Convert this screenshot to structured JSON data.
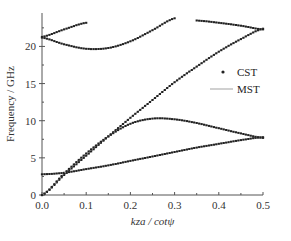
{
  "chart_data": {
    "type": "line",
    "title": "",
    "xlabel": "k_z a / cotψ",
    "ylabel": "Frequency / GHz",
    "xlim": [
      0.0,
      0.5
    ],
    "ylim": [
      0,
      24.5
    ],
    "xticks": [
      "0.0",
      "0.1",
      "0.2",
      "0.3",
      "0.4",
      "0.5"
    ],
    "yticks": [
      "0",
      "5",
      "10",
      "15",
      "20"
    ],
    "grid": false,
    "legend": {
      "position": "right-middle",
      "entries": [
        {
          "name": "CST",
          "style": "dots"
        },
        {
          "name": "MST",
          "style": "line"
        }
      ]
    },
    "x": [
      0.0,
      0.05,
      0.1,
      0.15,
      0.2,
      0.25,
      0.3,
      0.35,
      0.4,
      0.45,
      0.5
    ],
    "series": [
      {
        "name": "mode-1 (light-line-like)",
        "values": [
          0.0,
          2.7,
          5.3,
          7.9,
          10.4,
          12.8,
          15.2,
          17.3,
          19.3,
          21.0,
          22.4
        ]
      },
      {
        "name": "mode-2 (flat low)",
        "values": [
          2.8,
          3.0,
          3.5,
          4.0,
          4.6,
          5.2,
          5.8,
          6.4,
          6.9,
          7.4,
          7.8
        ]
      },
      {
        "name": "mode-3 (hump)",
        "values": [
          0.0,
          2.9,
          5.6,
          7.9,
          9.6,
          10.3,
          10.2,
          9.7,
          9.0,
          8.3,
          7.7
        ]
      },
      {
        "name": "mode-4 (upper descending)",
        "values": [
          21.2,
          20.3,
          19.7,
          19.8,
          20.7,
          22.2,
          23.8,
          null,
          null,
          null,
          null
        ]
      },
      {
        "name": "mode-5 (upper ascending)",
        "values": [
          21.3,
          22.3,
          23.2,
          null,
          null,
          null,
          null,
          null,
          null,
          null,
          null
        ]
      },
      {
        "name": "mode-6 (upper right)",
        "values": [
          null,
          null,
          null,
          null,
          null,
          null,
          null,
          23.5,
          23.2,
          22.8,
          22.3
        ]
      }
    ]
  },
  "plot": {
    "x_px": [
      42,
      263
    ],
    "y_px": [
      195,
      13
    ],
    "colors": {
      "cst": "#222222",
      "mst": "#b0b0b0",
      "axis": "#555555"
    }
  }
}
